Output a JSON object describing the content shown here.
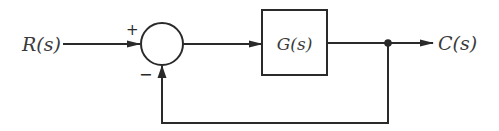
{
  "diagram": {
    "type": "negative-feedback-control-loop",
    "input_label": "R(s)",
    "output_label": "C(s)",
    "block_label": "G(s)",
    "summing_junction": {
      "plus_sign": "+",
      "minus_sign": "−"
    },
    "colors": {
      "stroke": "#2a2a2a",
      "text": "#3a3a3a",
      "background": "#ffffff"
    }
  }
}
